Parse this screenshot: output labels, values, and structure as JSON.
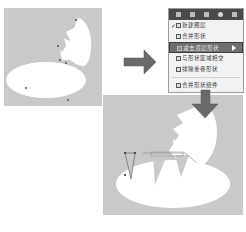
{
  "menu": {
    "toolbar_icons": [
      "layer-icon",
      "document-icon",
      "stack-icon",
      "gear-icon",
      "wand-icon"
    ],
    "items": [
      {
        "label": "新建图层",
        "checked": true,
        "icon": "new-layer-icon"
      },
      {
        "label": "合并形状",
        "checked": false,
        "icon": "combine-shapes-icon"
      },
      {
        "label": "减去顶层形状",
        "checked": false,
        "icon": "subtract-front-shape-icon",
        "selected": true
      },
      {
        "label": "与形状区域相交",
        "checked": false,
        "icon": "intersect-shape-areas-icon"
      },
      {
        "label": "排除重叠形状",
        "checked": false,
        "icon": "exclude-overlapping-icon"
      },
      {
        "label": "合并形状组件",
        "checked": false,
        "icon": "merge-components-icon"
      }
    ]
  },
  "colors": {
    "canvas": "#c9c9c9",
    "shape": "#ffffff",
    "arrow": "#6a6a6a",
    "menu_toolbar": "#4a4a4a",
    "menu_selected": "#6f6f6f"
  }
}
